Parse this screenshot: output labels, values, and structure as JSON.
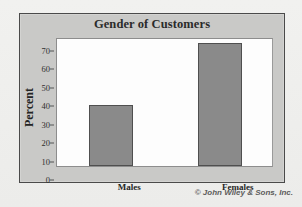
{
  "footer": {
    "credit": "© John Wiley & Sons, Inc."
  },
  "chart_data": {
    "type": "bar",
    "title": "Gender of Customers",
    "xlabel": "",
    "ylabel": "Percent",
    "categories": [
      "Males",
      "Females"
    ],
    "values": [
      33,
      67
    ],
    "ylim": [
      0,
      70
    ],
    "ytick_step": 10,
    "yticks": [
      0,
      10,
      20,
      30,
      40,
      50,
      60,
      70
    ],
    "ytick_labels": [
      "0",
      "10",
      "20",
      "30",
      "40",
      "50",
      "60",
      "70"
    ],
    "grid": false,
    "legend": false,
    "colors": {
      "bar_fill": "#8a8a8a",
      "bar_border": "#4f4f4f",
      "plot_background": "#fdfdfd",
      "frame_background": "#c9c9c7",
      "frame_border": "#4a4a4a",
      "page_background": "#eeeeec",
      "text": "#2b2b2b"
    }
  }
}
